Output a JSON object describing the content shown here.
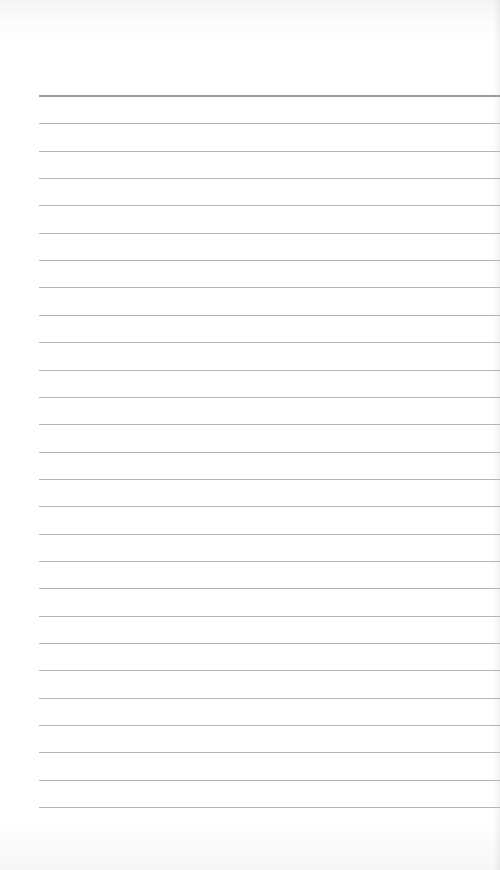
{
  "page": {
    "type": "ruled-notepad-page",
    "header_rule": {
      "y": 95
    },
    "rules": {
      "first_y": 96,
      "count": 27,
      "spacing": 27.35,
      "left_x": 39
    },
    "colors": {
      "paper": "#ffffff",
      "rule": "#b4b4b4",
      "header_rule": "#9a9a9a"
    },
    "content_text": []
  }
}
